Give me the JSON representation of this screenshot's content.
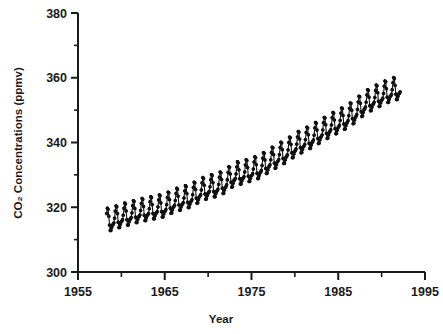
{
  "chart_data": {
    "type": "line",
    "title": "",
    "xlabel": "Year",
    "ylabel": "CO2 Concentrations (ppmv)",
    "ylabel_display": "CO₂ Concentrations (ppmv)",
    "xlim": [
      1955,
      1995
    ],
    "ylim": [
      300,
      380
    ],
    "grid": false,
    "legend": "none",
    "xticks_major": [
      1955,
      1965,
      1975,
      1985,
      1995
    ],
    "xticks_minor": [
      1960,
      1970,
      1980,
      1990
    ],
    "xtick_labels": [
      "1955",
      "1965",
      "1975",
      "1985",
      "1995"
    ],
    "yticks_major": [
      300,
      320,
      340,
      360,
      380
    ],
    "yticks_minor": [
      310,
      330,
      350,
      370
    ],
    "ytick_labels": [
      "300",
      "320",
      "340",
      "360",
      "380"
    ],
    "marker": "star-plus",
    "marker_color": "#111111",
    "line_color": "#111111",
    "series": [
      {
        "name": "Mauna Loa monthly mean CO2",
        "x_start": 1958.3,
        "x_end": 1992.2,
        "sampling": "monthly",
        "seasonal_amplitude_ppm": 3.1,
        "seasonal_peak_month": 5,
        "annual_means": [
          {
            "year": 1958,
            "value": 315.3
          },
          {
            "year": 1959,
            "value": 315.9
          },
          {
            "year": 1960,
            "value": 316.9
          },
          {
            "year": 1961,
            "value": 317.6
          },
          {
            "year": 1962,
            "value": 318.4
          },
          {
            "year": 1963,
            "value": 318.9
          },
          {
            "year": 1964,
            "value": 319.5
          },
          {
            "year": 1965,
            "value": 320.0
          },
          {
            "year": 1966,
            "value": 321.4
          },
          {
            "year": 1967,
            "value": 322.2
          },
          {
            "year": 1968,
            "value": 323.0
          },
          {
            "year": 1969,
            "value": 324.6
          },
          {
            "year": 1970,
            "value": 325.7
          },
          {
            "year": 1971,
            "value": 326.3
          },
          {
            "year": 1972,
            "value": 327.5
          },
          {
            "year": 1973,
            "value": 329.7
          },
          {
            "year": 1974,
            "value": 330.2
          },
          {
            "year": 1975,
            "value": 331.1
          },
          {
            "year": 1976,
            "value": 332.0
          },
          {
            "year": 1977,
            "value": 333.8
          },
          {
            "year": 1978,
            "value": 335.4
          },
          {
            "year": 1979,
            "value": 336.8
          },
          {
            "year": 1980,
            "value": 338.7
          },
          {
            "year": 1981,
            "value": 340.1
          },
          {
            "year": 1982,
            "value": 341.4
          },
          {
            "year": 1983,
            "value": 343.0
          },
          {
            "year": 1984,
            "value": 344.6
          },
          {
            "year": 1985,
            "value": 346.0
          },
          {
            "year": 1986,
            "value": 347.4
          },
          {
            "year": 1987,
            "value": 349.2
          },
          {
            "year": 1988,
            "value": 351.6
          },
          {
            "year": 1989,
            "value": 353.1
          },
          {
            "year": 1990,
            "value": 354.4
          },
          {
            "year": 1991,
            "value": 355.6
          },
          {
            "year": 1992,
            "value": 356.4
          }
        ]
      }
    ]
  }
}
